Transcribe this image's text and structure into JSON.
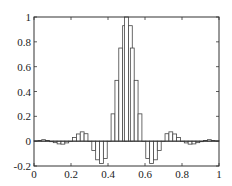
{
  "chart_data": {
    "type": "bar",
    "style": "stairs",
    "title": "",
    "xlabel": "",
    "ylabel": "",
    "xlim": [
      0,
      1
    ],
    "ylim": [
      -0.2,
      1
    ],
    "grid": false,
    "legend": null,
    "xticks": [
      0,
      0.2,
      0.4,
      0.6,
      0.8,
      1
    ],
    "xtick_labels": [
      "0",
      "0.2",
      "0.4",
      "0.6",
      "0.8",
      "1"
    ],
    "yticks": [
      -0.2,
      0,
      0.2,
      0.4,
      0.6,
      0.8,
      1
    ],
    "ytick_labels": [
      "-0.2",
      "0",
      "0.2",
      "0.4",
      "0.6",
      "0.8",
      "1"
    ],
    "bar_width": 0.0208,
    "x": [
      0.0,
      0.0208,
      0.0417,
      0.0625,
      0.0833,
      0.1042,
      0.125,
      0.1458,
      0.1667,
      0.1875,
      0.2083,
      0.2292,
      0.25,
      0.2708,
      0.2917,
      0.3125,
      0.3333,
      0.3542,
      0.375,
      0.3958,
      0.4167,
      0.4375,
      0.4583,
      0.4792,
      0.4896,
      0.5104,
      0.5208,
      0.5417,
      0.5625,
      0.5833,
      0.6042,
      0.625,
      0.6458,
      0.6667,
      0.6875,
      0.7083,
      0.7292,
      0.75,
      0.7708,
      0.7917,
      0.8125,
      0.8333,
      0.8542,
      0.875,
      0.8958,
      0.9167,
      0.9375,
      0.9583,
      0.9792
    ],
    "values": [
      0.003,
      0.006,
      0.012,
      0.006,
      -0.004,
      -0.012,
      -0.022,
      -0.024,
      -0.014,
      0.0,
      0.03,
      0.058,
      0.075,
      0.06,
      0.0,
      -0.075,
      -0.15,
      -0.18,
      -0.14,
      0.0,
      0.22,
      0.49,
      0.75,
      0.93,
      1.0,
      0.93,
      0.75,
      0.49,
      0.22,
      0.0,
      -0.14,
      -0.18,
      -0.15,
      -0.075,
      0.0,
      0.06,
      0.075,
      0.058,
      0.03,
      0.0,
      -0.014,
      -0.024,
      -0.022,
      -0.012,
      -0.004,
      0.006,
      0.012,
      0.006,
      0.003
    ]
  }
}
